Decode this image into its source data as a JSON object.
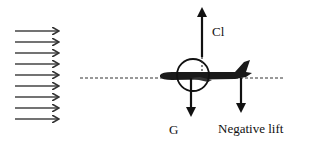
{
  "diagram": {
    "airflow": {
      "arrow_count": 9,
      "direction": "right"
    },
    "labels": {
      "lift": "Cl",
      "gravity": "G",
      "negative_lift": "Negative lift"
    },
    "colors": {
      "stroke": "#222222",
      "background": "#ffffff"
    }
  }
}
